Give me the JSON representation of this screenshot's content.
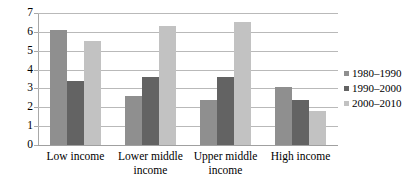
{
  "chart_data": {
    "type": "bar",
    "title": "",
    "subtitle": "",
    "xlabel": "",
    "ylabel": "",
    "ylim": [
      0,
      7
    ],
    "ytick_step": 1,
    "yticks": [
      "7",
      "6",
      "5",
      "4",
      "3",
      "2",
      "1",
      "0"
    ],
    "grid": true,
    "legend_position": "right",
    "categories": [
      "Low income",
      "Lower middle income",
      "Upper middle income",
      "High income"
    ],
    "series": [
      {
        "name": "1980–1990",
        "color": "#8f8f8f",
        "values": [
          6.1,
          2.6,
          2.4,
          3.1
        ]
      },
      {
        "name": "1990–2000",
        "color": "#636363",
        "values": [
          3.4,
          3.6,
          3.6,
          2.4
        ]
      },
      {
        "name": "2000–2010",
        "color": "#c2c2c2",
        "values": [
          5.5,
          6.3,
          6.5,
          1.8
        ]
      }
    ]
  },
  "colors": {
    "series_1980_1990": "#8f8f8f",
    "series_1990_2000": "#636363",
    "series_2000_2010": "#c2c2c2",
    "gridline": "#b9b9b9",
    "axis": "#a8a8a8",
    "background": "#ffffff",
    "text": "#000000"
  }
}
